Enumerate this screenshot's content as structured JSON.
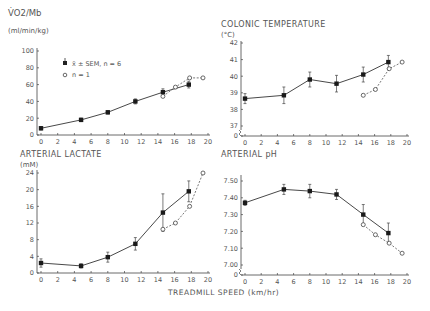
{
  "figure": {
    "xlabel": "TREADMILL SPEED (km/hr)",
    "legend": {
      "mean_label": "x̄ ± SEM, n = 6",
      "single_label": "n = 1"
    }
  },
  "chart_data": [
    {
      "type": "line",
      "id": "vo2",
      "title": "V̇O2/Mb",
      "ylabel": "(ml/min/kg)",
      "xlabel": "TREADMILL SPEED (km/hr)",
      "xlim": [
        0,
        20
      ],
      "ylim": [
        0,
        100
      ],
      "xticks": [
        0,
        2,
        4,
        6,
        8,
        10,
        12,
        14,
        16,
        18,
        20
      ],
      "yticks": [
        0,
        20,
        40,
        60,
        80,
        100
      ],
      "legend_position": "upper left",
      "series": [
        {
          "name": "x̄ ± SEM, n = 6",
          "style": "solid, filled square",
          "x": [
            0,
            4.8,
            8,
            11.3,
            14.6,
            17.7
          ],
          "y": [
            8,
            18,
            27,
            40,
            51,
            60
          ],
          "err": [
            2,
            2,
            2,
            3,
            4,
            4
          ]
        },
        {
          "name": "n = 1",
          "style": "dashed, open circle",
          "x": [
            14.6,
            16.1,
            17.8,
            19.4
          ],
          "y": [
            46,
            57,
            68,
            68
          ]
        }
      ]
    },
    {
      "type": "line",
      "id": "temp",
      "title": "COLONIC TEMPERATURE",
      "ylabel": "(°C)",
      "xlabel": "TREADMILL SPEED (km/hr)",
      "xlim": [
        0,
        20
      ],
      "ylim": [
        37,
        42
      ],
      "axis_break": true,
      "xticks": [
        0,
        2,
        4,
        6,
        8,
        10,
        12,
        14,
        16,
        18,
        20
      ],
      "yticks": [
        0,
        37,
        38,
        39,
        40,
        41,
        42
      ],
      "series": [
        {
          "name": "x̄ ± SEM, n = 6",
          "style": "solid, filled square",
          "x": [
            0,
            4.8,
            8,
            11.3,
            14.6,
            17.7
          ],
          "y": [
            38.65,
            38.85,
            39.8,
            39.55,
            40.1,
            40.85
          ],
          "err": [
            0.3,
            0.5,
            0.45,
            0.5,
            0.45,
            0.4
          ]
        },
        {
          "name": "n = 1",
          "style": "dashed, open circle",
          "x": [
            14.6,
            16.1,
            17.8,
            19.4
          ],
          "y": [
            38.85,
            39.2,
            40.45,
            40.85
          ]
        }
      ]
    },
    {
      "type": "line",
      "id": "lactate",
      "title": "ARTERIAL LACTATE",
      "ylabel": "(mM)",
      "xlabel": "TREADMILL SPEED (km/hr)",
      "xlim": [
        0,
        20
      ],
      "ylim": [
        0,
        24
      ],
      "xticks": [
        0,
        2,
        4,
        6,
        8,
        10,
        12,
        14,
        16,
        18,
        20
      ],
      "yticks": [
        0,
        4,
        8,
        12,
        16,
        20,
        24
      ],
      "series": [
        {
          "name": "x̄ ± SEM, n = 6",
          "style": "solid, filled square",
          "x": [
            0,
            4.8,
            8,
            11.3,
            14.6,
            17.7
          ],
          "y": [
            2.4,
            1.7,
            3.8,
            7.0,
            14.5,
            19.6
          ],
          "err": [
            1.0,
            0.5,
            1.2,
            1.5,
            4.5,
            2.5
          ]
        },
        {
          "name": "n = 1",
          "style": "dashed, open circle",
          "x": [
            14.6,
            16.1,
            17.8,
            19.4
          ],
          "y": [
            10.5,
            12.0,
            16.0,
            24.0
          ]
        }
      ]
    },
    {
      "type": "line",
      "id": "ph",
      "title": "ARTERIAL pH",
      "ylabel": "",
      "xlabel": "TREADMILL SPEED (km/hr)",
      "xlim": [
        0,
        20
      ],
      "ylim": [
        7.0,
        7.5
      ],
      "axis_break": true,
      "xticks": [
        0,
        2,
        4,
        6,
        8,
        10,
        12,
        14,
        16,
        18,
        20
      ],
      "yticks": [
        "0",
        "7.00",
        "7.10",
        "7.20",
        "7.30",
        "7.40",
        "7.50"
      ],
      "series": [
        {
          "name": "x̄ ± SEM, n = 6",
          "style": "solid, filled square",
          "x": [
            0,
            4.8,
            8,
            11.3,
            14.6,
            17.7
          ],
          "y": [
            7.37,
            7.45,
            7.44,
            7.42,
            7.3,
            7.19
          ],
          "err": [
            0.015,
            0.03,
            0.04,
            0.03,
            0.06,
            0.06
          ]
        },
        {
          "name": "n = 1",
          "style": "dashed, open circle",
          "x": [
            14.6,
            16.1,
            17.8,
            19.4
          ],
          "y": [
            7.24,
            7.18,
            7.13,
            7.07
          ]
        }
      ]
    }
  ]
}
